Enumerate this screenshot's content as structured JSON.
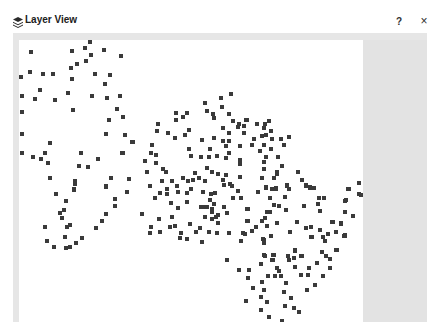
{
  "window": {
    "title": "Layer View",
    "icon": "layers-icon",
    "help_label": "?",
    "close_label": "×"
  },
  "colors": {
    "panel_bg": "#e6e6e6",
    "canvas_bg": "#ffffff",
    "dot": "#3a3a3a"
  },
  "layer": {
    "points": [
      [
        31,
        52
      ],
      [
        72,
        51
      ],
      [
        85,
        48
      ],
      [
        90,
        42
      ],
      [
        104,
        50
      ],
      [
        91,
        55
      ],
      [
        121,
        56
      ],
      [
        86,
        61
      ],
      [
        77,
        64
      ],
      [
        71,
        68
      ],
      [
        30,
        72
      ],
      [
        43,
        74
      ],
      [
        53,
        74
      ],
      [
        21,
        77
      ],
      [
        72,
        79
      ],
      [
        95,
        74
      ],
      [
        110,
        75
      ],
      [
        105,
        84
      ],
      [
        40,
        90
      ],
      [
        68,
        93
      ],
      [
        22,
        96
      ],
      [
        35,
        99
      ],
      [
        55,
        100
      ],
      [
        92,
        96
      ],
      [
        107,
        98
      ],
      [
        120,
        96
      ],
      [
        22,
        112
      ],
      [
        73,
        110
      ],
      [
        117,
        109
      ],
      [
        109,
        120
      ],
      [
        123,
        117
      ],
      [
        22,
        134
      ],
      [
        50,
        143
      ],
      [
        106,
        134
      ],
      [
        125,
        135
      ],
      [
        132,
        142
      ],
      [
        22,
        153
      ],
      [
        33,
        157
      ],
      [
        41,
        159
      ],
      [
        45,
        153
      ],
      [
        48,
        163
      ],
      [
        81,
        153
      ],
      [
        98,
        159
      ],
      [
        122,
        153
      ],
      [
        79,
        166
      ],
      [
        88,
        167
      ],
      [
        50,
        178
      ],
      [
        75,
        181
      ],
      [
        75,
        184
      ],
      [
        111,
        178
      ],
      [
        129,
        179
      ],
      [
        106,
        186
      ],
      [
        74,
        189
      ],
      [
        56,
        194
      ],
      [
        74,
        190
      ],
      [
        106,
        187
      ],
      [
        127,
        192
      ],
      [
        66,
        201
      ],
      [
        115,
        199
      ],
      [
        64,
        210
      ],
      [
        60,
        213
      ],
      [
        62,
        218
      ],
      [
        115,
        206
      ],
      [
        106,
        214
      ],
      [
        102,
        221
      ],
      [
        96,
        228
      ],
      [
        45,
        227
      ],
      [
        67,
        227
      ],
      [
        70,
        225
      ],
      [
        65,
        237
      ],
      [
        82,
        238
      ],
      [
        47,
        241
      ],
      [
        76,
        243
      ],
      [
        54,
        247
      ],
      [
        66,
        248
      ],
      [
        70,
        247
      ],
      [
        231,
        94
      ],
      [
        221,
        98
      ],
      [
        205,
        103
      ],
      [
        222,
        107
      ],
      [
        207,
        111
      ],
      [
        213,
        114
      ],
      [
        214,
        118
      ],
      [
        229,
        114
      ],
      [
        176,
        113
      ],
      [
        187,
        113
      ],
      [
        183,
        117
      ],
      [
        176,
        120
      ],
      [
        158,
        124
      ],
      [
        157,
        131
      ],
      [
        233,
        121
      ],
      [
        239,
        124
      ],
      [
        246,
        120
      ],
      [
        238,
        127
      ],
      [
        244,
        126
      ],
      [
        223,
        128
      ],
      [
        244,
        133
      ],
      [
        229,
        133
      ],
      [
        189,
        130
      ],
      [
        168,
        133
      ],
      [
        185,
        135
      ],
      [
        175,
        138
      ],
      [
        133,
        142
      ],
      [
        202,
        140
      ],
      [
        214,
        138
      ],
      [
        223,
        141
      ],
      [
        229,
        141
      ],
      [
        152,
        145
      ],
      [
        240,
        146
      ],
      [
        226,
        146
      ],
      [
        189,
        149
      ],
      [
        210,
        149
      ],
      [
        151,
        153
      ],
      [
        156,
        155
      ],
      [
        191,
        156
      ],
      [
        201,
        157
      ],
      [
        209,
        157
      ],
      [
        217,
        156
      ],
      [
        229,
        153
      ],
      [
        226,
        158
      ],
      [
        145,
        161
      ],
      [
        156,
        163
      ],
      [
        240,
        160
      ],
      [
        240,
        164
      ],
      [
        123,
        153
      ],
      [
        163,
        169
      ],
      [
        166,
        172
      ],
      [
        147,
        172
      ],
      [
        207,
        168
      ],
      [
        212,
        172
      ],
      [
        218,
        174
      ],
      [
        226,
        175
      ],
      [
        195,
        173
      ],
      [
        183,
        178
      ],
      [
        188,
        181
      ],
      [
        193,
        180
      ],
      [
        199,
        178
      ],
      [
        205,
        181
      ],
      [
        172,
        181
      ],
      [
        162,
        181
      ],
      [
        223,
        180
      ],
      [
        224,
        185
      ],
      [
        230,
        184
      ],
      [
        232,
        186
      ],
      [
        240,
        177
      ],
      [
        150,
        186
      ],
      [
        177,
        186
      ],
      [
        191,
        189
      ],
      [
        167,
        189
      ],
      [
        238,
        191
      ],
      [
        160,
        193
      ],
      [
        167,
        194
      ],
      [
        178,
        192
      ],
      [
        187,
        193
      ],
      [
        203,
        192
      ],
      [
        211,
        194
      ],
      [
        215,
        193
      ],
      [
        155,
        198
      ],
      [
        210,
        200
      ],
      [
        233,
        198
      ],
      [
        241,
        198
      ],
      [
        171,
        203
      ],
      [
        187,
        202
      ],
      [
        214,
        204
      ],
      [
        201,
        207
      ],
      [
        204,
        207
      ],
      [
        207,
        207
      ],
      [
        212,
        209
      ],
      [
        224,
        207
      ],
      [
        178,
        208
      ],
      [
        142,
        214
      ],
      [
        218,
        215
      ],
      [
        227,
        213
      ],
      [
        212,
        212
      ],
      [
        216,
        217
      ],
      [
        212,
        219
      ],
      [
        205,
        217
      ],
      [
        172,
        217
      ],
      [
        159,
        219
      ],
      [
        247,
        209
      ],
      [
        218,
        223
      ],
      [
        247,
        221
      ],
      [
        190,
        224
      ],
      [
        175,
        226
      ],
      [
        170,
        227
      ],
      [
        151,
        227
      ],
      [
        200,
        228
      ],
      [
        196,
        232
      ],
      [
        209,
        232
      ],
      [
        217,
        233
      ],
      [
        229,
        233
      ],
      [
        243,
        233
      ],
      [
        181,
        233
      ],
      [
        160,
        232
      ],
      [
        150,
        233
      ],
      [
        180,
        238
      ],
      [
        187,
        239
      ],
      [
        247,
        120
      ],
      [
        257,
        124
      ],
      [
        265,
        124
      ],
      [
        269,
        121
      ],
      [
        264,
        128
      ],
      [
        271,
        131
      ],
      [
        262,
        136
      ],
      [
        266,
        135
      ],
      [
        254,
        139
      ],
      [
        272,
        139
      ],
      [
        281,
        139
      ],
      [
        289,
        137
      ],
      [
        252,
        145
      ],
      [
        264,
        145
      ],
      [
        284,
        145
      ],
      [
        260,
        151
      ],
      [
        271,
        149
      ],
      [
        266,
        157
      ],
      [
        278,
        157
      ],
      [
        264,
        162
      ],
      [
        282,
        166
      ],
      [
        264,
        169
      ],
      [
        277,
        172
      ],
      [
        277,
        174
      ],
      [
        298,
        172
      ],
      [
        262,
        178
      ],
      [
        274,
        178
      ],
      [
        302,
        180
      ],
      [
        287,
        185
      ],
      [
        306,
        185
      ],
      [
        310,
        187
      ],
      [
        314,
        188
      ],
      [
        266,
        187
      ],
      [
        273,
        189
      ],
      [
        276,
        189
      ],
      [
        289,
        189
      ],
      [
        349,
        189
      ],
      [
        258,
        192
      ],
      [
        266,
        188
      ],
      [
        272,
        189
      ],
      [
        276,
        188
      ],
      [
        287,
        186
      ],
      [
        289,
        189
      ],
      [
        306,
        186
      ],
      [
        310,
        188
      ],
      [
        314,
        188
      ],
      [
        348,
        189
      ],
      [
        359,
        194
      ],
      [
        270,
        198
      ],
      [
        285,
        197
      ],
      [
        319,
        198
      ],
      [
        324,
        198
      ],
      [
        346,
        200
      ],
      [
        274,
        205
      ],
      [
        279,
        206
      ],
      [
        304,
        206
      ],
      [
        318,
        204
      ],
      [
        248,
        209
      ],
      [
        286,
        210
      ],
      [
        267,
        212
      ],
      [
        270,
        212
      ],
      [
        320,
        211
      ],
      [
        345,
        212
      ],
      [
        353,
        216
      ],
      [
        265,
        218
      ],
      [
        248,
        221
      ],
      [
        262,
        221
      ],
      [
        297,
        222
      ],
      [
        277,
        223
      ],
      [
        332,
        222
      ],
      [
        341,
        224
      ],
      [
        267,
        226
      ],
      [
        256,
        227
      ],
      [
        252,
        231
      ],
      [
        306,
        228
      ],
      [
        311,
        227
      ],
      [
        320,
        230
      ],
      [
        290,
        232
      ],
      [
        245,
        234
      ],
      [
        328,
        234
      ],
      [
        336,
        232
      ],
      [
        344,
        236
      ],
      [
        271,
        236
      ],
      [
        312,
        237
      ],
      [
        323,
        237
      ],
      [
        325,
        241
      ],
      [
        264,
        240
      ],
      [
        264,
        243
      ],
      [
        336,
        250
      ],
      [
        295,
        251
      ],
      [
        322,
        252
      ],
      [
        265,
        256
      ],
      [
        274,
        255
      ],
      [
        288,
        256
      ],
      [
        302,
        256
      ],
      [
        326,
        256
      ],
      [
        330,
        259
      ],
      [
        273,
        260
      ],
      [
        289,
        260
      ],
      [
        294,
        258
      ],
      [
        317,
        263
      ],
      [
        261,
        264
      ],
      [
        359,
        183
      ],
      [
        361,
        195
      ],
      [
        345,
        201
      ],
      [
        333,
        222
      ],
      [
        341,
        223
      ],
      [
        345,
        235
      ],
      [
        202,
        242
      ],
      [
        241,
        241
      ],
      [
        263,
        239
      ],
      [
        264,
        242
      ],
      [
        271,
        236
      ],
      [
        311,
        237
      ],
      [
        345,
        236
      ],
      [
        227,
        260
      ],
      [
        264,
        255
      ],
      [
        273,
        255
      ],
      [
        272,
        260
      ],
      [
        288,
        256
      ],
      [
        295,
        250
      ],
      [
        301,
        256
      ],
      [
        337,
        250
      ],
      [
        239,
        270
      ],
      [
        249,
        270
      ],
      [
        248,
        278
      ],
      [
        277,
        268
      ],
      [
        279,
        271
      ],
      [
        295,
        267
      ],
      [
        309,
        268
      ],
      [
        330,
        268
      ],
      [
        268,
        276
      ],
      [
        275,
        276
      ],
      [
        281,
        276
      ],
      [
        301,
        275
      ],
      [
        308,
        275
      ],
      [
        323,
        276
      ],
      [
        262,
        282
      ],
      [
        286,
        283
      ],
      [
        315,
        285
      ],
      [
        253,
        288
      ],
      [
        264,
        290
      ],
      [
        284,
        292
      ],
      [
        307,
        290
      ],
      [
        261,
        297
      ],
      [
        291,
        298
      ],
      [
        246,
        301
      ],
      [
        267,
        302
      ],
      [
        285,
        306
      ],
      [
        294,
        308
      ],
      [
        261,
        310
      ],
      [
        299,
        312
      ],
      [
        269,
        317
      ],
      [
        282,
        321
      ]
    ]
  }
}
